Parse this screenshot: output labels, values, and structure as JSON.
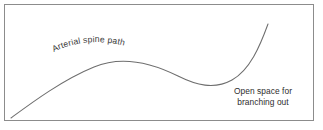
{
  "diagram": {
    "title_text": "Arterial spine path",
    "note": {
      "line1": "Open space for",
      "line2": "branching out"
    },
    "colors": {
      "background": "#ffffff",
      "border": "#8c8c8c",
      "curve": "#6e6e6e",
      "text": "#2e2e2e"
    },
    "frame": {
      "x": 4,
      "y": 4,
      "width": 310,
      "height": 117
    },
    "curve": {
      "path": "M 11 118 C 30 104, 62 80, 94 67 C 120 56, 150 62, 178 76 C 196 85, 214 90, 232 80 C 250 70, 260 46, 268 24",
      "start": [
        11,
        118
      ],
      "peak": [
        115,
        62
      ],
      "trough": [
        210,
        86
      ],
      "end": [
        268,
        24
      ]
    }
  },
  "chart_data": {
    "type": "line",
    "title": "Arterial spine path",
    "xlabel": "",
    "ylabel": "",
    "grid": false,
    "legend": null,
    "annotations": [
      {
        "text": "Arterial spine path",
        "x": 100,
        "y": 52,
        "along_curve": true
      },
      {
        "text": "Open space for branching out",
        "x": 263,
        "y": 96,
        "along_curve": false
      }
    ],
    "series": [
      {
        "name": "spine",
        "x": [
          11,
          40,
          70,
          95,
          115,
          140,
          165,
          185,
          205,
          225,
          245,
          258,
          268
        ],
        "y": [
          118,
          98,
          76,
          66,
          62,
          64,
          71,
          79,
          86,
          85,
          62,
          42,
          24
        ]
      }
    ]
  }
}
